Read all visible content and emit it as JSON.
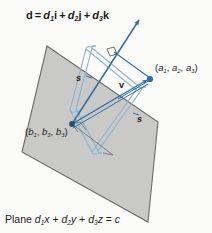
{
  "figure": {
    "title_label": "d = d1i + d2j + d3k",
    "caption": "Plane d1x + d2y + d3z = c",
    "colors": {
      "plane_fill": "#c9c9c7",
      "plane_stroke": "#6b6b69",
      "vector_blue": "#2f6ea5",
      "light_blue": "#8db4d2",
      "text_dark": "#1d1d1b",
      "background": "#fbfbfa"
    },
    "normal_vector": {
      "name": "d",
      "equation_prefix": "d",
      "equals": "=",
      "term1_coef": "d",
      "term1_sub": "1",
      "term1_unit": "i",
      "plus1": "+",
      "term2_coef": "d",
      "term2_sub": "2",
      "term2_unit": "j",
      "plus2": "+",
      "term3_coef": "d",
      "term3_sub": "3",
      "term3_unit": "k"
    },
    "point_a": {
      "open": "(",
      "c1": "a",
      "c1s": "1",
      "sep1": ", ",
      "c2": "a",
      "c2s": "2",
      "sep2": ", ",
      "c3": "a",
      "c3s": "3",
      "close": ")"
    },
    "point_b": {
      "open": "(",
      "c1": "b",
      "c1s": "1",
      "sep1": ", ",
      "c2": "b",
      "c2s": "3",
      "sep2": ", ",
      "c3": "b",
      "c3s": "3",
      "close": ")"
    },
    "vector_v_label": "v",
    "distance_label_left": "s",
    "distance_label_right": "s",
    "plane_equation": {
      "word": "Plane ",
      "t1c": "d",
      "t1s": "1",
      "t1v": "x",
      "p1": " + ",
      "t2c": "d",
      "t2s": "2",
      "t2v": "y",
      "p2": " + ",
      "t3c": "d",
      "t3s": "3",
      "t3v": "z",
      "eq": " = ",
      "rhs": "c"
    },
    "right_angle_marker": "right-angle"
  }
}
